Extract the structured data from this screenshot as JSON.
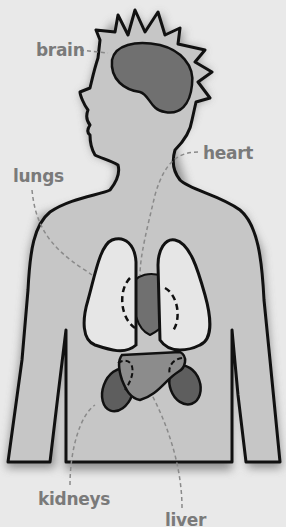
{
  "diagram": {
    "colors": {
      "background": "#e9e9e9",
      "body": "#c6c6c6",
      "outline": "#111111",
      "organ_dark": "#707070",
      "lungs": "#e6e6e6",
      "liver": "#8c8c8c",
      "label": "#7a7a7a"
    },
    "labels": {
      "brain": "brain",
      "heart": "heart",
      "lungs": "lungs",
      "kidneys": "kidneys",
      "liver": "liver"
    }
  }
}
